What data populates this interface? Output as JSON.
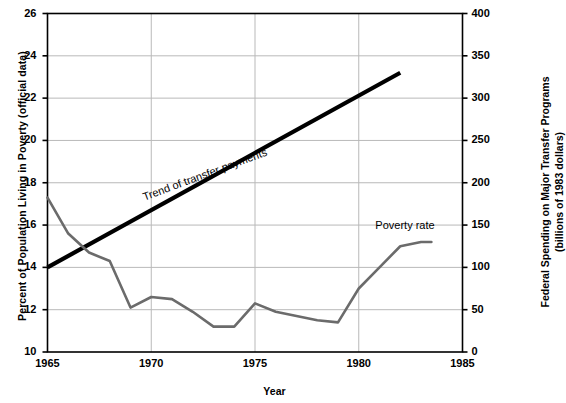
{
  "chart_data": {
    "type": "line",
    "title": "",
    "xlabel": "Year",
    "ylabel": "Percent of Population Living in Poverty (official data)",
    "ylabel_right_line1": "Federal Spending on Major Transfer Programs",
    "ylabel_right_line2": "(billions of 1983 dollars)",
    "xlim": [
      1965,
      1985
    ],
    "ylim": [
      10,
      26
    ],
    "ylim_right": [
      0,
      400
    ],
    "grid": true,
    "legend_position": "inline-annotations",
    "xticks": [
      "1965",
      "1970",
      "1975",
      "1980",
      "1985"
    ],
    "xtick_values": [
      1965,
      1970,
      1975,
      1980,
      1985
    ],
    "yticks_left": [
      "10",
      "12",
      "14",
      "16",
      "18",
      "20",
      "22",
      "24",
      "26"
    ],
    "ytick_values_left": [
      10,
      12,
      14,
      16,
      18,
      20,
      22,
      24,
      26
    ],
    "yticks_right": [
      "0",
      "50",
      "100",
      "150",
      "200",
      "250",
      "300",
      "350",
      "400"
    ],
    "ytick_values_right": [
      0,
      50,
      100,
      150,
      200,
      250,
      300,
      350,
      400
    ],
    "series": [
      {
        "name": "Poverty rate",
        "axis": "left",
        "color": "#6b6b6b",
        "line_width": 2.6,
        "x": [
          1965,
          1966,
          1967,
          1968,
          1969,
          1970,
          1971,
          1972,
          1973,
          1974,
          1975,
          1976,
          1977,
          1978,
          1979,
          1980,
          1981,
          1982,
          1983,
          1983.5
        ],
        "values": [
          17.3,
          15.6,
          14.7,
          14.3,
          12.1,
          12.6,
          12.5,
          11.9,
          11.2,
          11.2,
          12.3,
          11.9,
          11.7,
          11.5,
          11.4,
          13.0,
          14.0,
          15.0,
          15.2,
          15.2
        ]
      },
      {
        "name": "Trend of transfer payments",
        "axis": "right",
        "color": "#000000",
        "line_width": 4.2,
        "x": [
          1965,
          1982
        ],
        "values": [
          100,
          330
        ],
        "values_left_scale": [
          14.0,
          23.2
        ]
      }
    ],
    "annotations": [
      {
        "name": "trend-label",
        "text": "Trend of transfer payments",
        "x": 1969.6,
        "y_left": 17.6,
        "rotation_deg": -20.3
      },
      {
        "name": "poverty-label",
        "text": "Poverty rate",
        "x": 1980.8,
        "y_left": 15.9,
        "rotation_deg": 0
      }
    ]
  },
  "colors": {
    "axis": "#000000",
    "grid": "#b9b9b9",
    "poverty_line": "#6b6b6b",
    "trend_line": "#000000",
    "background": "#ffffff"
  }
}
